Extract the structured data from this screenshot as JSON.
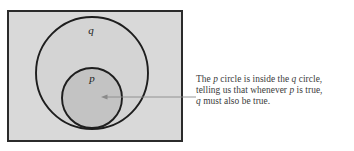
{
  "figure": {
    "name": "venn-diagram-p-inside-q",
    "universe_box": {
      "fill": "#d9d9d9",
      "stroke": "#2b2b2b"
    },
    "circles": [
      {
        "label": "q",
        "role": "outer-circle",
        "cx": 92,
        "cy": 73,
        "r": 56,
        "fill": "#d4d4d4",
        "stroke": "#1e1e1e",
        "label_x": 91,
        "label_y": 34
      },
      {
        "label": "p",
        "role": "inner-circle",
        "cx": 92,
        "cy": 98,
        "r": 30,
        "fill": "#c3c3c3",
        "stroke": "#1e1e1e",
        "label_x": 92,
        "label_y": 82
      }
    ],
    "annotation": {
      "arrow": {
        "color": "#8a8a8a",
        "from_x": 196,
        "to_x": 101,
        "y": 97
      },
      "caption_lines": [
        "The p circle is inside the q circle,",
        "telling us that whenever p is true,",
        "q must also be true."
      ],
      "caption_text": "The p circle is inside the q circle, telling us that whenever p is true, q must also be true."
    }
  }
}
